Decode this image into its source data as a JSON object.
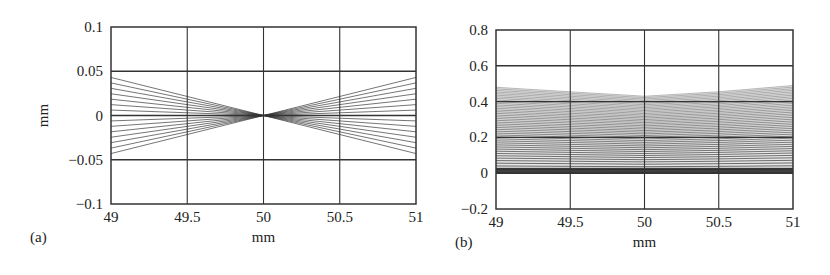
{
  "figure": {
    "panels": [
      {
        "id": "a",
        "label": "(a)"
      },
      {
        "id": "b",
        "label": "(b)"
      }
    ]
  },
  "chart_data": [
    {
      "type": "line",
      "panel_label": "(a)",
      "title": "",
      "xlabel": "mm",
      "ylabel": "mm",
      "xlim": [
        49,
        51
      ],
      "ylim": [
        -0.1,
        0.1
      ],
      "xticks": [
        "49",
        "49.5",
        "50",
        "50.5",
        "51"
      ],
      "yticks": [
        "0.1",
        "0.05",
        "0",
        "−0.05",
        "−0.1"
      ],
      "xtick_values": [
        49,
        49.5,
        50,
        50.5,
        51
      ],
      "ytick_values": [
        0.1,
        0.05,
        0,
        -0.05,
        -0.1
      ],
      "grid": true,
      "description": "Ray fan converging to a focal point at (50, 0); rays span ±0.043 mm at x=49 and x=51",
      "focus": {
        "x": 50,
        "y": 0
      },
      "ray_count": 15,
      "ray_half_span_at_edges": 0.043,
      "line_color": "#333333"
    },
    {
      "type": "line",
      "panel_label": "(b)",
      "title": "",
      "xlabel": "mm",
      "ylabel": "",
      "xlim": [
        49,
        51
      ],
      "ylim": [
        -0.2,
        0.8
      ],
      "xticks": [
        "49",
        "49.5",
        "50",
        "50.5",
        "51"
      ],
      "yticks": [
        "0.8",
        "0.6",
        "0.4",
        "0.2",
        "0",
        "−0.2"
      ],
      "xtick_values": [
        49,
        49.5,
        50,
        50.5,
        51
      ],
      "ytick_values": [
        0.8,
        0.6,
        0.4,
        0.2,
        0,
        -0.2
      ],
      "grid": true,
      "description": "Dense bundle of near-horizontal rays from y=0 up to ~0.48; top envelope dips to ~0.43 near x=50 and rises to ~0.49 at x=51; densest near y=0",
      "envelope_top": [
        {
          "x": 49,
          "y": 0.48
        },
        {
          "x": 49.5,
          "y": 0.455
        },
        {
          "x": 50,
          "y": 0.43
        },
        {
          "x": 50.5,
          "y": 0.455
        },
        {
          "x": 51,
          "y": 0.49
        }
      ],
      "envelope_bottom": 0,
      "ray_count": 45,
      "line_color": "#333333"
    }
  ]
}
